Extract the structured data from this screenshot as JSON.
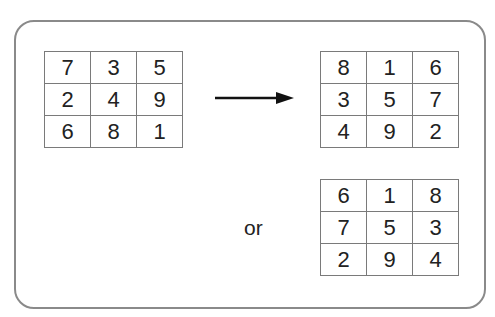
{
  "diagram": {
    "source_square": [
      [
        7,
        3,
        5
      ],
      [
        2,
        4,
        9
      ],
      [
        6,
        8,
        1
      ]
    ],
    "result_square_a": [
      [
        8,
        1,
        6
      ],
      [
        3,
        5,
        7
      ],
      [
        4,
        9,
        2
      ]
    ],
    "result_square_b": [
      [
        6,
        1,
        8
      ],
      [
        7,
        5,
        3
      ],
      [
        2,
        9,
        4
      ]
    ],
    "connector_label": "or",
    "arrow_icon": "right-arrow-icon",
    "colors": {
      "border": "#8a8a8a",
      "text": "#222222",
      "arrow": "#111111"
    }
  }
}
